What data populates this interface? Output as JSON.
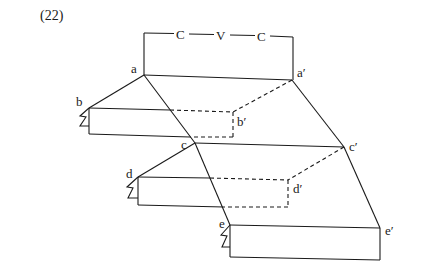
{
  "figure": {
    "number": "(22)",
    "bracket": {
      "segments": [
        "C",
        "V",
        "C"
      ]
    },
    "nodes": {
      "a": "a",
      "a_prime": "a′",
      "b": "b",
      "b_prime": "b′",
      "c": "c",
      "c_prime": "c′",
      "d": "d",
      "d_prime": "d′",
      "e": "e",
      "e_prime": "e′"
    }
  },
  "colors": {
    "ink": "#1a1a1a",
    "background": "#ffffff"
  }
}
